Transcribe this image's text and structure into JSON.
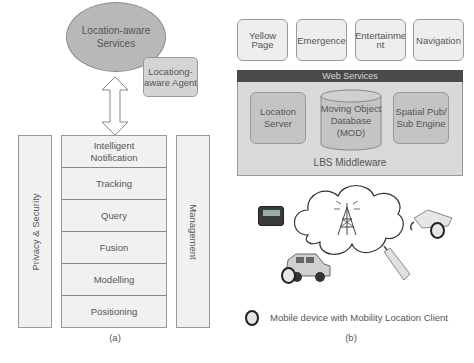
{
  "panel_a": {
    "caption": "(a)",
    "ellipse": {
      "line1": "Location-aware",
      "line2": "Services"
    },
    "agent": {
      "line1": "Locationg-",
      "line2": "aware Agent"
    },
    "arrow": "bidirectional-arrow",
    "left_bar": "Privacy & Security",
    "right_bar": "Management",
    "layers": [
      {
        "line1": "Intelligent",
        "line2": "Notification"
      },
      {
        "line1": "Tracking"
      },
      {
        "line1": "Query"
      },
      {
        "line1": "Fusion"
      },
      {
        "line1": "Modelling"
      },
      {
        "line1": "Positioning"
      }
    ]
  },
  "panel_b": {
    "caption": "(b)",
    "apps": [
      {
        "line1": "Yellow Page"
      },
      {
        "line1": "Emergence"
      },
      {
        "line1": "Entertainme",
        "line2": "nt"
      },
      {
        "line1": "Navigation"
      }
    ],
    "web_services": "Web Services",
    "middleware_label": "LBS Middleware",
    "components": {
      "location_server": {
        "line1": "Location",
        "line2": "Server"
      },
      "mod": {
        "line1": "Moving Object",
        "line2": "Database",
        "line3": "(MOD)"
      },
      "pubsub": {
        "line1": "Spatial Pub/",
        "line2": "Sub Engine"
      }
    },
    "network": {
      "cloud": "cloud",
      "tower": "antenna-tower",
      "devices": [
        "pager",
        "car",
        "mobile-phone",
        "pda"
      ]
    },
    "legend": "Mobile device with Mobility Location Client"
  },
  "colors": {
    "ellipse": "#b8b8b8",
    "agent": "#d4d4d4",
    "layer_fill": "#f1f1f1",
    "web_services_bar": "#4a4a4a",
    "middleware_fill": "#d9d9d9",
    "component_fill": "#c4c4c4"
  }
}
